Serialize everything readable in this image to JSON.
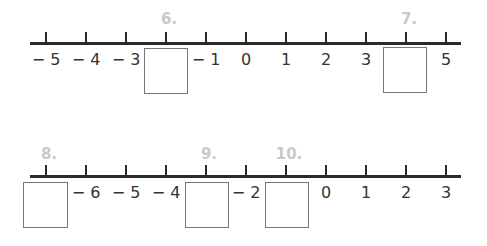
{
  "worksheet": {
    "number_lines": [
      {
        "id": "line-1",
        "ticks": [
          {
            "value": "− 5",
            "blank": false
          },
          {
            "value": "− 4",
            "blank": false
          },
          {
            "value": "− 3",
            "blank": false
          },
          {
            "value": "",
            "blank": true,
            "question": "6."
          },
          {
            "value": "− 1",
            "blank": false
          },
          {
            "value": "0",
            "blank": false
          },
          {
            "value": "1",
            "blank": false
          },
          {
            "value": "2",
            "blank": false
          },
          {
            "value": "3",
            "blank": false
          },
          {
            "value": "",
            "blank": true,
            "question": "7."
          },
          {
            "value": "5",
            "blank": false
          }
        ]
      },
      {
        "id": "line-2",
        "ticks": [
          {
            "value": "",
            "blank": true,
            "question": "8."
          },
          {
            "value": "− 6",
            "blank": false
          },
          {
            "value": "− 5",
            "blank": false
          },
          {
            "value": "− 4",
            "blank": false
          },
          {
            "value": "",
            "blank": true,
            "question": "9."
          },
          {
            "value": "− 2",
            "blank": false
          },
          {
            "value": "",
            "blank": true,
            "question": "10."
          },
          {
            "value": "0",
            "blank": false
          },
          {
            "value": "1",
            "blank": false
          },
          {
            "value": "2",
            "blank": false
          },
          {
            "value": "3",
            "blank": false
          }
        ]
      }
    ]
  }
}
